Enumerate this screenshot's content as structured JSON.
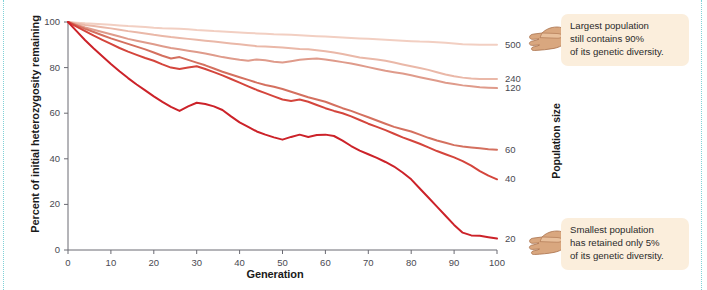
{
  "chart": {
    "type": "line",
    "xlabel": "Generation",
    "ylabel": "Percent of initial heterozygosity remaining",
    "right_axis_label": "Population size",
    "xlim": [
      0,
      100
    ],
    "ylim": [
      0,
      100
    ],
    "xticks": [
      "0",
      "10",
      "20",
      "30",
      "40",
      "50",
      "60",
      "70",
      "80",
      "90",
      "100"
    ],
    "yticks": [
      "0",
      "20",
      "40",
      "60",
      "80",
      "100"
    ],
    "grid": false,
    "legend_position": "right-axis-endpoint-labels"
  },
  "annotations": {
    "top": {
      "icon": "pointing-hand-icon",
      "line1": "Largest population",
      "line2": "still contains 90%",
      "line3": "of its genetic diversity."
    },
    "bottom": {
      "icon": "pointing-hand-icon",
      "line1": "Smallest population",
      "line2": "has retained only 5%",
      "line3": "of its genetic diversity."
    }
  },
  "colors": {
    "pop500": "#f2cfc2",
    "pop240": "#eab8a8",
    "pop120": "#df9b8b",
    "pop60": "#d4705f",
    "pop40": "#d4453c",
    "pop20": "#cc2229",
    "callout_bg": "#fbeedc",
    "axis": "#6a6a72",
    "edge_rule": "#7fd2d8"
  },
  "chart_data": {
    "type": "line",
    "title": "",
    "xlabel": "Generation",
    "ylabel": "Percent of initial heterozygosity remaining",
    "right_ylabel": "Population size",
    "xlim": [
      0,
      100
    ],
    "ylim": [
      0,
      100
    ],
    "xticks": [
      0,
      10,
      20,
      30,
      40,
      50,
      60,
      70,
      80,
      90,
      100
    ],
    "yticks": [
      0,
      20,
      40,
      60,
      80,
      100
    ],
    "grid": false,
    "x": [
      0,
      2,
      4,
      6,
      8,
      10,
      12,
      14,
      16,
      18,
      20,
      22,
      24,
      26,
      28,
      30,
      32,
      34,
      36,
      38,
      40,
      42,
      44,
      46,
      48,
      50,
      52,
      54,
      56,
      58,
      60,
      62,
      64,
      66,
      68,
      70,
      72,
      74,
      76,
      78,
      80,
      82,
      84,
      86,
      88,
      90,
      92,
      94,
      96,
      98,
      100
    ],
    "series": [
      {
        "name": "500",
        "label": "500",
        "color": "#f2cfc2",
        "end_value": 90,
        "values": [
          100,
          99.7,
          99.4,
          99.2,
          99.0,
          98.8,
          98.5,
          98.2,
          98.0,
          97.8,
          97.5,
          97.3,
          97.2,
          97.0,
          96.8,
          96.5,
          96.3,
          96.0,
          95.8,
          95.6,
          95.4,
          95.2,
          95.0,
          94.8,
          94.6,
          94.5,
          94.4,
          94.2,
          94.0,
          93.8,
          93.6,
          93.4,
          93.2,
          93.0,
          92.8,
          92.6,
          92.4,
          92.2,
          92.0,
          91.8,
          91.6,
          91.4,
          91.3,
          91.1,
          90.9,
          90.6,
          90.2,
          90.1,
          90.0,
          90.0,
          90.0
        ]
      },
      {
        "name": "240",
        "label": "240",
        "color": "#eab8a8",
        "end_value": 75,
        "values": [
          100,
          99.3,
          98.7,
          98.2,
          97.7,
          97.2,
          96.6,
          96.0,
          95.5,
          95.0,
          94.4,
          93.9,
          93.4,
          93.0,
          92.6,
          92.2,
          91.8,
          91.4,
          91.0,
          90.6,
          90.2,
          89.8,
          89.4,
          89.2,
          89.0,
          88.8,
          88.5,
          88.2,
          88.0,
          87.6,
          87.2,
          86.6,
          86.0,
          85.2,
          84.4,
          84.0,
          83.6,
          83.0,
          82.2,
          81.4,
          80.6,
          79.8,
          79.0,
          78.0,
          77.0,
          76.2,
          75.6,
          75.2,
          75.0,
          75.0,
          75.0
        ]
      },
      {
        "name": "120",
        "label": "120",
        "color": "#df9b8b",
        "end_value": 71,
        "values": [
          100,
          98.8,
          97.6,
          96.6,
          95.6,
          94.6,
          93.6,
          92.6,
          91.8,
          91.0,
          90.2,
          89.4,
          88.6,
          88.0,
          87.4,
          86.8,
          86.2,
          85.4,
          84.6,
          84.0,
          83.4,
          83.0,
          83.6,
          83.2,
          82.6,
          82.2,
          82.8,
          83.4,
          83.8,
          84.0,
          83.6,
          83.0,
          82.4,
          81.8,
          81.0,
          80.2,
          79.4,
          78.6,
          78.0,
          77.4,
          76.6,
          75.8,
          75.0,
          74.2,
          73.4,
          72.8,
          72.2,
          71.8,
          71.4,
          71.2,
          71.0
        ]
      },
      {
        "name": "60",
        "label": "60",
        "color": "#d4705f",
        "end_value": 44,
        "values": [
          100,
          98.5,
          97.0,
          95.6,
          94.2,
          92.8,
          91.6,
          90.4,
          89.2,
          88.0,
          86.6,
          85.2,
          84.0,
          84.6,
          83.4,
          82.2,
          81.0,
          79.6,
          78.2,
          77.0,
          75.8,
          74.6,
          73.4,
          72.4,
          71.6,
          70.6,
          69.4,
          68.2,
          67.0,
          66.0,
          65.0,
          63.6,
          62.2,
          61.0,
          59.6,
          58.2,
          56.8,
          55.4,
          54.0,
          53.0,
          52.0,
          50.6,
          49.2,
          48.0,
          47.0,
          46.0,
          45.4,
          45.0,
          44.6,
          44.2,
          44.0
        ]
      },
      {
        "name": "40",
        "label": "40",
        "color": "#d4453c",
        "end_value": 31,
        "values": [
          100,
          98.0,
          96.0,
          94.0,
          92.2,
          90.4,
          88.6,
          87.0,
          85.6,
          84.2,
          83.0,
          81.4,
          80.0,
          79.4,
          80.0,
          80.6,
          79.4,
          78.0,
          76.6,
          75.0,
          73.4,
          71.8,
          70.2,
          68.8,
          67.4,
          66.0,
          65.4,
          66.0,
          65.0,
          63.6,
          62.2,
          61.0,
          60.0,
          58.6,
          57.0,
          55.4,
          54.0,
          52.6,
          51.0,
          49.4,
          48.0,
          46.6,
          45.0,
          43.4,
          42.0,
          40.6,
          39.0,
          37.0,
          34.6,
          32.6,
          31.0
        ]
      },
      {
        "name": "20",
        "label": "20",
        "color": "#cc2229",
        "end_value": 5,
        "values": [
          100,
          96.0,
          92.0,
          88.4,
          85.0,
          81.6,
          78.4,
          75.4,
          72.6,
          70.0,
          67.4,
          65.0,
          62.8,
          61.0,
          63.0,
          64.6,
          64.0,
          63.0,
          61.4,
          58.6,
          56.0,
          54.0,
          52.0,
          50.6,
          49.4,
          48.4,
          49.6,
          50.6,
          49.6,
          50.4,
          50.6,
          50.0,
          48.0,
          45.6,
          43.6,
          42.0,
          40.4,
          38.6,
          36.6,
          34.0,
          31.0,
          27.0,
          23.0,
          19.0,
          15.0,
          11.0,
          7.6,
          6.4,
          6.2,
          5.6,
          5.0
        ]
      }
    ]
  }
}
